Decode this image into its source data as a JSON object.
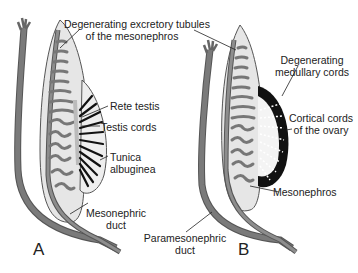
{
  "diagram": {
    "panel_a": {
      "letter": "A",
      "labels": {
        "excretory_tubules_1": "Degenerating excretory tubules",
        "excretory_tubules_2": "of the mesonephros",
        "rete_testis": "Rete testis",
        "testis_cords": "Testis cords",
        "tunica_1": "Tunica",
        "tunica_2": "albuginea",
        "mesonephric_duct_1": "Mesonephric",
        "mesonephric_duct_2": "duct"
      }
    },
    "panel_b": {
      "letter": "B",
      "labels": {
        "medullary_1": "Degenerating",
        "medullary_2": "medullary cords",
        "cortical_1": "Cortical cords",
        "cortical_2": "of the ovary",
        "mesonephros": "Mesonephros",
        "paramesonephric_1": "Paramesonephric",
        "paramesonephric_2": "duct"
      }
    },
    "colors": {
      "duct_dark": "#6e6e6e",
      "tissue_light": "#e4e4e4",
      "tubule": "#8a8a8a",
      "outline": "#555555",
      "cortex_black": "#111111"
    }
  }
}
